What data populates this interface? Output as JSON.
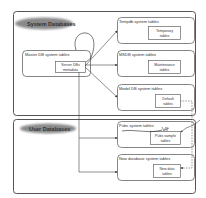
{
  "groups": {
    "system": {
      "label": "System Databases"
    },
    "user": {
      "label": "User Databases"
    }
  },
  "nodes": {
    "master": {
      "title": "Master DB system tables",
      "inner_line1": "Server DBs",
      "inner_line2": "metadata"
    },
    "tempdb": {
      "title": "Tempdb system tables",
      "inner_line1": "Temporary",
      "inner_line2": "tables"
    },
    "msdb": {
      "title": "MSDB system tables",
      "inner_line1": "Maintenance",
      "inner_line2": "tables"
    },
    "model": {
      "title": "Model DB system tables",
      "inner_line1": "Default",
      "inner_line2": "tables"
    },
    "pubs": {
      "title": "Pubs system tables",
      "inner_line1": "Pubs sample",
      "inner_line2": "tables"
    },
    "newdb": {
      "title": "New database system tables",
      "inner_line1": "New data",
      "inner_line2": "tables"
    }
  },
  "colors": {
    "stroke": "#555555",
    "blob": "#8a8a8a",
    "text": "#333333"
  }
}
